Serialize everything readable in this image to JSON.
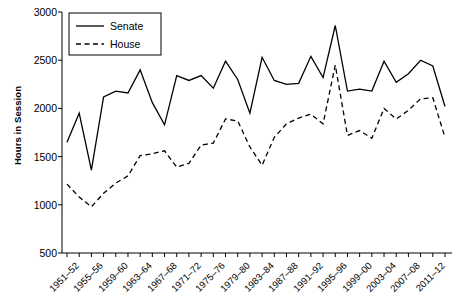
{
  "chart_data": {
    "type": "line",
    "title": "",
    "xlabel": "",
    "ylabel": "Hours in Session",
    "ylim": [
      500,
      3000
    ],
    "yticks": [
      500,
      1000,
      1500,
      2000,
      2500,
      3000
    ],
    "grid": false,
    "legend_position": "top-left",
    "legend": [
      "Senate",
      "House"
    ],
    "categories": [
      "1951–52",
      "1953–54",
      "1955–56",
      "1957–58",
      "1959–60",
      "1961–62",
      "1963–64",
      "1965–66",
      "1967–68",
      "1969–70",
      "1971–72",
      "1973–74",
      "1975–76",
      "1977–78",
      "1979–80",
      "1981–82",
      "1983–84",
      "1985–86",
      "1987–88",
      "1989–90",
      "1991–92",
      "1993–94",
      "1995–96",
      "1997–98",
      "1999–00",
      "2001–02",
      "2003–04",
      "2005–06",
      "2007–08",
      "2009–10",
      "2011–12",
      "2013–14"
    ],
    "tick_labels_shown": [
      "1951–52",
      "1955–56",
      "1959–60",
      "1963–64",
      "1967–68",
      "1971–72",
      "1975–76",
      "1979–80",
      "1983–84",
      "1987–88",
      "1991–92",
      "1995–96",
      "1999–00",
      "2003–04",
      "2007–08",
      "2011–12"
    ],
    "tick_label_interval": 2,
    "series": [
      {
        "name": "Senate",
        "style": "solid",
        "color": "#000000",
        "values": [
          1650,
          1950,
          1360,
          2120,
          2180,
          2160,
          2400,
          2060,
          1830,
          2340,
          2290,
          2340,
          2210,
          2490,
          2300,
          1950,
          2530,
          2290,
          2250,
          2260,
          2540,
          2320,
          2860,
          2180,
          2200,
          2180,
          2490,
          2270,
          2360,
          2500,
          2440,
          2020
        ]
      },
      {
        "name": "House",
        "style": "dashed",
        "color": "#000000",
        "values": [
          1215,
          1080,
          980,
          1120,
          1225,
          1300,
          1510,
          1530,
          1560,
          1390,
          1430,
          1620,
          1640,
          1890,
          1870,
          1600,
          1410,
          1700,
          1840,
          1900,
          1940,
          1840,
          2450,
          1720,
          1770,
          1690,
          2000,
          1890,
          1980,
          2100,
          2110,
          1700
        ]
      }
    ]
  }
}
